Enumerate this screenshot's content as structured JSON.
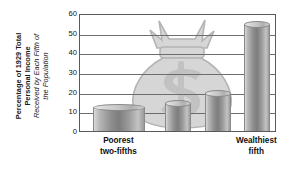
{
  "chart_data": {
    "type": "bar",
    "title": "",
    "subtitle": "",
    "ylabel_bold": "Percentage of 1929 Total Personal Income",
    "ylabel_italic": "Received by Each Fifth of the Population",
    "ylabel_bold_lines": [
      "Percentage of 1929 Total",
      "Personal Income"
    ],
    "ylabel_italic_lines": [
      "Received by Each Fifth of",
      "the Population"
    ],
    "xlabel": "",
    "ylim": [
      0,
      60
    ],
    "yticks": [
      0,
      10,
      20,
      30,
      40,
      50,
      60
    ],
    "ytick_labels": [
      "0",
      "10",
      "20",
      "30",
      "40",
      "50",
      "60"
    ],
    "grid": true,
    "legend": "none",
    "categories": [
      "Poorest two-fifths",
      "Third fifth",
      "Fourth fifth",
      "Wealthiest fifth"
    ],
    "values": [
      12,
      14,
      19,
      54
    ],
    "bars": [
      {
        "label": "Poorest two-fifths",
        "value": 12,
        "wide": true
      },
      {
        "label": "Third fifth",
        "value": 14,
        "wide": false
      },
      {
        "label": "Fourth fifth",
        "value": 19,
        "wide": false
      },
      {
        "label": "Wealthiest fifth",
        "value": 54,
        "wide": false
      }
    ],
    "axis_labels": [
      {
        "line1": "Poorest",
        "line2": "two-fifths"
      },
      {
        "line1": "Wealthiest",
        "line2": "fifth"
      }
    ],
    "annotation_graphic": "money-bag-with-dollar-sign",
    "colors": {
      "bar_light": "#d8d8d8",
      "bar_dark": "#7d7d7d",
      "gridline": "#6d6d6d",
      "border": "#5a5a5a",
      "background": "#ffffff",
      "watermark": "#d5d5d5",
      "text": "#111111"
    }
  }
}
